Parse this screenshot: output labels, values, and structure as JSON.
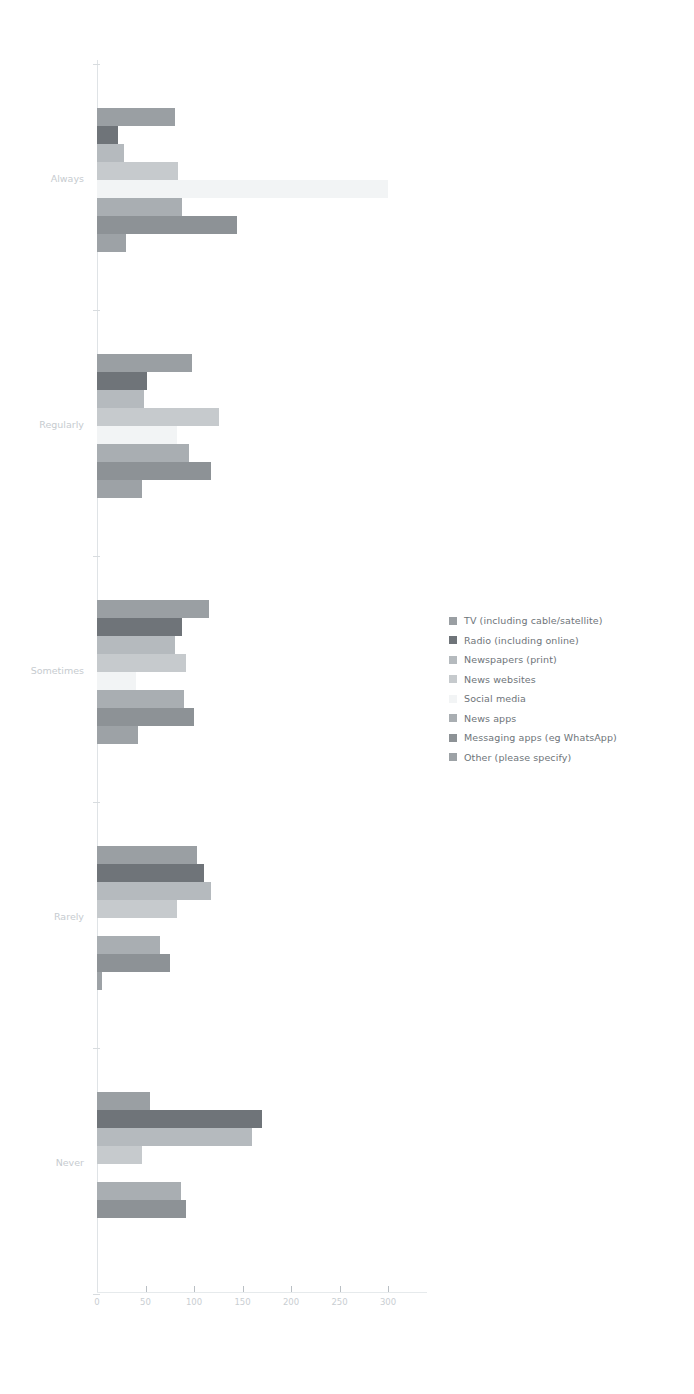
{
  "chart_data": {
    "type": "bar",
    "orientation": "horizontal",
    "title": "",
    "subtitle": "",
    "xlabel": "",
    "ylabel": "",
    "grid": false,
    "legend_position": "right",
    "xlim": [
      0,
      320
    ],
    "xticks": [
      0,
      50,
      100,
      150,
      200,
      250,
      300
    ],
    "xtick_labels": [
      "0",
      "50",
      "100",
      "150",
      "200",
      "250",
      "300"
    ],
    "categories": [
      "Always",
      "Regularly",
      "Sometimes",
      "Rarely",
      "Never"
    ],
    "series": [
      {
        "name": "TV (including cable/satellite)",
        "color": "#9a9fa3",
        "values": [
          80,
          98,
          115,
          103,
          55
        ]
      },
      {
        "name": "Radio (including online)",
        "color": "#6f7479",
        "values": [
          22,
          52,
          88,
          110,
          170
        ]
      },
      {
        "name": "Newspapers (print)",
        "color": "#b5babe",
        "values": [
          28,
          48,
          80,
          118,
          160
        ]
      },
      {
        "name": "News websites",
        "color": "#c6cacd",
        "values": [
          84,
          126,
          92,
          82,
          46
        ]
      },
      {
        "name": "Social media",
        "color": "#f2f4f5",
        "values": [
          300,
          82,
          40,
          0,
          0
        ]
      },
      {
        "name": "News apps",
        "color": "#a9aeb2",
        "values": [
          88,
          95,
          90,
          65,
          87
        ]
      },
      {
        "name": "Messaging apps (eg WhatsApp)",
        "color": "#8d9296",
        "values": [
          144,
          118,
          100,
          75,
          92
        ]
      },
      {
        "name": "Other (please specify)",
        "color": "#9da2a6",
        "values": [
          30,
          46,
          42,
          5,
          0
        ]
      }
    ]
  },
  "legend": {
    "items": [
      "TV (including cable/satellite)",
      "Radio (including online)",
      "Newspapers (print)",
      "News websites",
      "Social media",
      "News apps",
      "Messaging apps (eg WhatsApp)",
      "Other (please specify)"
    ]
  }
}
